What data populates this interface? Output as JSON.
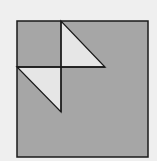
{
  "figure": {
    "background": "#efefef",
    "square": {
      "x": 17,
      "y": 21,
      "width": 131,
      "height": 136,
      "fill": "#a6a6a6",
      "stroke": "#1a1a1a"
    },
    "lines": [
      {
        "name": "vertical-divider",
        "x1": 61,
        "y1": 21,
        "x2": 61,
        "y2": 112
      },
      {
        "name": "horizontal-divider",
        "x1": 17,
        "y1": 67,
        "x2": 105,
        "y2": 67
      }
    ],
    "triangles": [
      {
        "name": "upper-triangle",
        "points": "61,21 61,67 105,67",
        "fill": "#e6e6e6"
      },
      {
        "name": "lower-triangle",
        "points": "17,67 61,67 61,112",
        "fill": "#e6e6e6"
      }
    ],
    "stroke_color": "#1a1a1a"
  }
}
